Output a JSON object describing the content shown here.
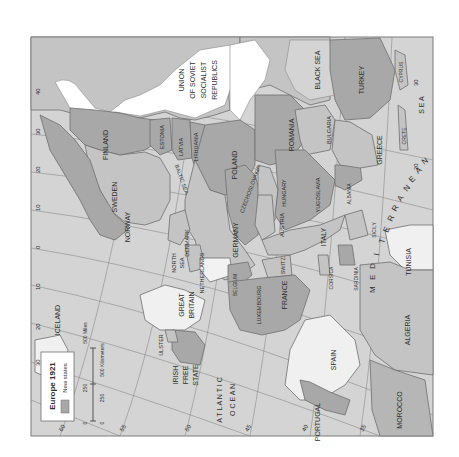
{
  "map": {
    "title": "Europe 1921",
    "orientation": "rotated 90 degrees clockwise",
    "colors": {
      "sea": "#d4d4d4",
      "land_default": "#c4c4c4",
      "new_states": "#9e9e9e",
      "neutral_light": "#e6e6e6",
      "white_land": "#f4f4f4",
      "border": "#6f6f6f",
      "frame": "#7a7a7a"
    },
    "legend": {
      "title": "Europe 1921",
      "items": [
        {
          "label": "New states",
          "swatch_color": "#a8a8a8"
        }
      ]
    },
    "scale_bar": {
      "miles_labels": [
        "0",
        "250",
        "500 Miles"
      ],
      "km_labels": [
        "0",
        "250",
        "500 Kilometers"
      ]
    },
    "countries": {
      "ussr": "UNION OF SOVIET SOCIALIST REPUBLICS",
      "ussr_lines": [
        "UNION",
        "OF SOVIET",
        "SOCIALIST",
        "REPUBLICS"
      ],
      "finland": "FINLAND",
      "estonia": "ESTONIA",
      "latvia": "LATVIA",
      "lithuania": "LITHUANIA",
      "sweden": "SWEDEN",
      "norway": "NORWAY",
      "denmark": "DENMARK",
      "poland": "POLAND",
      "germany": "GERMANY",
      "czechoslovakia": "CZECHOSLOVAKIA",
      "austria": "AUSTRIA",
      "hungary": "HUNGARY",
      "romania": "ROMANIA",
      "bulgaria": "BULGARIA",
      "yugoslavia": "YUGOSLAVIA",
      "albania": "ALBANIA",
      "greece": "GREECE",
      "turkey": "TURKEY",
      "cyprus": "CYPRUS",
      "crete": "CRETE",
      "italy": "ITALY",
      "sicily": "SICILY",
      "sardinia": "SARDINIA",
      "corsica": "CORSICA",
      "switz": "SWITZ.",
      "france": "FRANCE",
      "luxembourg": "LUXEMBOURG",
      "belgium": "BELGIUM",
      "netherlands": "NETHERLANDS",
      "great_britain_lines": [
        "GREAT",
        "BRITAIN"
      ],
      "ulster": "ULSTER",
      "irish_free_state_lines": [
        "IRISH",
        "FREE",
        "STATE"
      ],
      "iceland": "ICELAND",
      "spain": "SPAIN",
      "portugal": "PORTUGAL",
      "morocco": "MOROCCO",
      "algeria": "ALGERIA",
      "tunisia": "TUNISIA"
    },
    "water": {
      "black_sea": "BLACK SEA",
      "baltic_sea": "BALTIC SEA",
      "north_sea_lines": [
        "NORTH",
        "SEA"
      ],
      "atlantic_ocean_lines": [
        "A T L A N T I C",
        "O C E A N"
      ],
      "mediterranean_letters": [
        "M",
        "E",
        "D",
        "I",
        "T",
        "E",
        "R",
        "R",
        "A",
        "N",
        "E",
        "A",
        "N"
      ],
      "sea_word": "S E A"
    },
    "graticule": {
      "longitude_labels_left_edge": [
        "40",
        "30",
        "20",
        "10",
        "0",
        "10",
        "20",
        "30"
      ],
      "latitude_labels_bottom_edge": [
        "60",
        "55",
        "50",
        "45",
        "40",
        "35"
      ],
      "right_edge_labels": [
        "30",
        "20"
      ]
    }
  }
}
